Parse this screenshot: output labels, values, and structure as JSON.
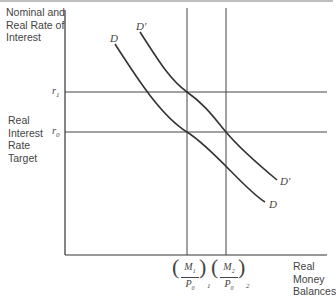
{
  "y_axis_label": [
    "Nominal and",
    "Real Rate of",
    "Interest"
  ],
  "left_label": [
    "Real",
    "Interest",
    "Rate",
    "Target"
  ],
  "x_axis_label": [
    "Real",
    "Money",
    "Balances"
  ],
  "ticks": {
    "r1": {
      "base": "r",
      "sub": "1"
    },
    "r0": {
      "base": "r",
      "sub": "0"
    },
    "m1": {
      "num": "M",
      "num_sub": "1",
      "den": "P",
      "den_sub": "0",
      "outer_sub": "1"
    },
    "m2": {
      "num": "M",
      "num_sub": "2",
      "den": "P",
      "den_sub": "0",
      "outer_sub": "2"
    }
  },
  "curves": {
    "D": {
      "label_top": "D",
      "label_bottom": "D"
    },
    "D_prime": {
      "label_top": "D'",
      "label_bottom": "D'"
    }
  },
  "colors": {
    "line": "#333333",
    "text": "#444444",
    "topbar": "#bdbdbd"
  }
}
